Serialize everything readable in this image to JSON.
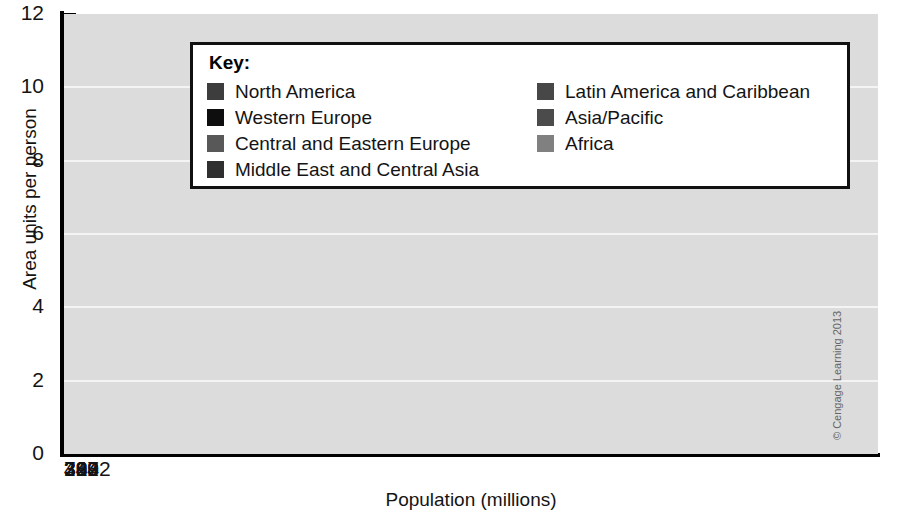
{
  "chart_data": {
    "type": "bar",
    "title": "",
    "xlabel": "Population (millions)",
    "ylabel": "Area units per person",
    "ylim": [
      0,
      12
    ],
    "yticks": [
      0,
      2,
      4,
      6,
      8,
      10,
      12
    ],
    "grid": true,
    "legend_position": "inside-top-center",
    "categories": [
      "299",
      "384",
      "343",
      "307",
      "484",
      "3222",
      "710"
    ],
    "series_names": [
      "North America",
      "Western Europe",
      "Central and Eastern Europe",
      "Middle East and Central Asia",
      "Latin America and Caribbean",
      "Asia/Pacific",
      "Africa"
    ],
    "values": [
      11.65,
      6.25,
      4.9,
      2.7,
      2.35,
      1.9,
      1.45
    ],
    "widths_population": [
      299,
      384,
      343,
      307,
      484,
      3222,
      710
    ],
    "bars": [
      {
        "name": "North America",
        "population": "299",
        "value": 11.65,
        "color": "#3d3d3d"
      },
      {
        "name": "Western Europe",
        "population": "384",
        "value": 6.25,
        "color": "#0e0e0e"
      },
      {
        "name": "Central and Eastern Europe",
        "population": "343",
        "value": 4.9,
        "color": "#585858"
      },
      {
        "name": "Middle East and Central Asia",
        "population": "307",
        "value": 2.7,
        "color": "#2f2f2f"
      },
      {
        "name": "Latin America and Caribbean",
        "population": "484",
        "value": 2.35,
        "color": "#474747"
      },
      {
        "name": "Asia/Pacific",
        "population": "3222",
        "value": 1.9,
        "color": "#4b4b4b"
      },
      {
        "name": "Africa",
        "population": "710",
        "value": 1.45,
        "color": "#808080"
      }
    ]
  },
  "legend": {
    "title": "Key:",
    "left_column": [
      {
        "label": "North America",
        "color": "#3d3d3d"
      },
      {
        "label": "Western Europe",
        "color": "#0e0e0e"
      },
      {
        "label": "Central and Eastern Europe",
        "color": "#585858"
      },
      {
        "label": "Middle East and Central Asia",
        "color": "#2f2f2f"
      }
    ],
    "right_column": [
      {
        "label": "Latin America and Caribbean",
        "color": "#474747"
      },
      {
        "label": "Asia/Pacific",
        "color": "#4b4b4b"
      },
      {
        "label": "Africa",
        "color": "#808080"
      }
    ]
  },
  "colors": {
    "plot_background": "#dcdcdc",
    "gridline": "#f4f4f4",
    "axis": "#000000",
    "page_background": "#ffffff",
    "text": "#141414"
  },
  "credit": "© Cengage Learning 2013"
}
